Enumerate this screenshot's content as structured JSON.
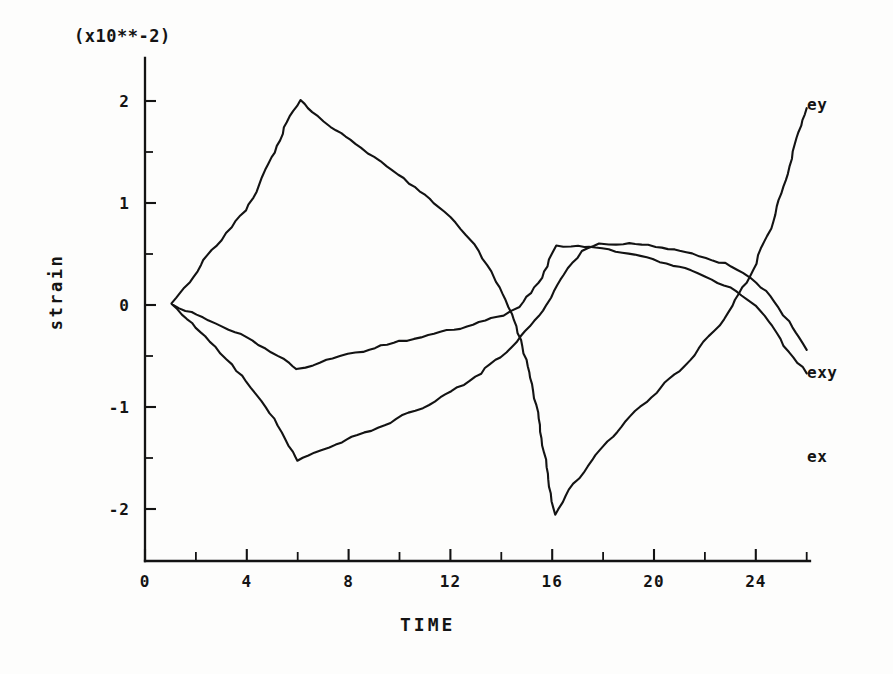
{
  "chart_data": {
    "type": "line",
    "title": "",
    "exponent_note": "(x10**-2)",
    "xlabel": "TIME",
    "ylabel": "strain",
    "xlim": [
      0,
      26
    ],
    "ylim": [
      -2.55,
      2.35
    ],
    "xticks": [
      0,
      4,
      8,
      12,
      16,
      20,
      24
    ],
    "xtick_labels": [
      "0",
      "4",
      "8",
      "12",
      "16",
      "20",
      "24"
    ],
    "xtick_minor": [
      2,
      6,
      10,
      14,
      18,
      22,
      26
    ],
    "yticks": [
      2,
      1,
      0,
      -1,
      -2
    ],
    "ytick_labels": [
      "2",
      "1",
      "0",
      "-1",
      "-2"
    ],
    "ytick_minor": [
      1.5,
      0.5,
      -0.5,
      -1.5
    ],
    "grid": false,
    "legend_position": "right-of-curve-ends",
    "series": [
      {
        "name": "ey",
        "label": "ey",
        "label_x": 25.7,
        "label_y": 1.96,
        "points": [
          [
            1.1,
            0.0
          ],
          [
            1.6,
            0.17
          ],
          [
            2.2,
            0.38
          ],
          [
            2.8,
            0.58
          ],
          [
            3.4,
            0.76
          ],
          [
            4.0,
            0.92
          ],
          [
            4.5,
            1.18
          ],
          [
            5.0,
            1.44
          ],
          [
            5.5,
            1.73
          ],
          [
            6.1,
            2.01
          ],
          [
            6.6,
            1.88
          ],
          [
            7.3,
            1.75
          ],
          [
            8.1,
            1.61
          ],
          [
            9.0,
            1.45
          ],
          [
            10.0,
            1.27
          ],
          [
            11.0,
            1.08
          ],
          [
            12.0,
            0.86
          ],
          [
            13.0,
            0.58
          ],
          [
            13.6,
            0.33
          ],
          [
            14.2,
            0.05
          ],
          [
            14.8,
            -0.35
          ],
          [
            15.3,
            -0.85
          ],
          [
            15.7,
            -1.45
          ],
          [
            16.1,
            -2.06
          ],
          [
            16.7,
            -1.82
          ],
          [
            17.4,
            -1.58
          ],
          [
            18.2,
            -1.34
          ],
          [
            19.1,
            -1.1
          ],
          [
            20.1,
            -0.86
          ],
          [
            21.2,
            -0.6
          ],
          [
            22.2,
            -0.32
          ],
          [
            23.1,
            -0.02
          ],
          [
            23.9,
            0.34
          ],
          [
            24.6,
            0.75
          ],
          [
            25.2,
            1.22
          ],
          [
            25.7,
            1.7
          ],
          [
            26.0,
            1.93
          ]
        ]
      },
      {
        "name": "exy",
        "label": "exy",
        "label_x": 25.7,
        "label_y": -0.67,
        "points": [
          [
            1.1,
            0.0
          ],
          [
            1.6,
            -0.06
          ],
          [
            2.3,
            -0.13
          ],
          [
            3.0,
            -0.21
          ],
          [
            3.8,
            -0.3
          ],
          [
            4.5,
            -0.39
          ],
          [
            5.2,
            -0.5
          ],
          [
            5.7,
            -0.58
          ],
          [
            6.0,
            -0.64
          ],
          [
            6.6,
            -0.59
          ],
          [
            7.4,
            -0.53
          ],
          [
            8.3,
            -0.47
          ],
          [
            9.3,
            -0.41
          ],
          [
            10.3,
            -0.35
          ],
          [
            11.4,
            -0.29
          ],
          [
            12.4,
            -0.23
          ],
          [
            13.4,
            -0.16
          ],
          [
            14.1,
            -0.1
          ],
          [
            14.7,
            -0.02
          ],
          [
            15.2,
            0.11
          ],
          [
            15.6,
            0.27
          ],
          [
            15.9,
            0.44
          ],
          [
            16.2,
            0.57
          ],
          [
            17.0,
            0.58
          ],
          [
            18.0,
            0.55
          ],
          [
            19.0,
            0.5
          ],
          [
            20.0,
            0.44
          ],
          [
            21.0,
            0.37
          ],
          [
            22.0,
            0.28
          ],
          [
            23.0,
            0.16
          ],
          [
            24.0,
            0.0
          ],
          [
            24.7,
            -0.22
          ],
          [
            25.3,
            -0.46
          ],
          [
            26.0,
            -0.67
          ]
        ]
      },
      {
        "name": "ex",
        "label": "ex",
        "label_x": 25.7,
        "label_y": -1.49,
        "points": [
          [
            1.1,
            0.0
          ],
          [
            1.5,
            -0.1
          ],
          [
            2.0,
            -0.22
          ],
          [
            2.6,
            -0.37
          ],
          [
            3.2,
            -0.53
          ],
          [
            3.8,
            -0.7
          ],
          [
            4.4,
            -0.88
          ],
          [
            4.9,
            -1.06
          ],
          [
            5.4,
            -1.26
          ],
          [
            5.8,
            -1.44
          ],
          [
            6.0,
            -1.53
          ],
          [
            6.7,
            -1.46
          ],
          [
            7.5,
            -1.37
          ],
          [
            8.4,
            -1.28
          ],
          [
            9.4,
            -1.18
          ],
          [
            10.4,
            -1.07
          ],
          [
            11.4,
            -0.95
          ],
          [
            12.3,
            -0.82
          ],
          [
            13.2,
            -0.67
          ],
          [
            14.0,
            -0.51
          ],
          [
            14.8,
            -0.32
          ],
          [
            15.5,
            -0.11
          ],
          [
            16.1,
            0.12
          ],
          [
            16.6,
            0.36
          ],
          [
            17.2,
            0.52
          ],
          [
            17.9,
            0.59
          ],
          [
            18.8,
            0.6
          ],
          [
            19.8,
            0.58
          ],
          [
            20.8,
            0.54
          ],
          [
            21.8,
            0.48
          ],
          [
            22.8,
            0.4
          ],
          [
            23.8,
            0.27
          ],
          [
            24.6,
            0.08
          ],
          [
            25.3,
            -0.16
          ],
          [
            26.0,
            -0.44
          ]
        ]
      }
    ]
  },
  "axes": {
    "x_label": "TIME",
    "y_label": "strain",
    "exponent": "(x10**-2)"
  }
}
